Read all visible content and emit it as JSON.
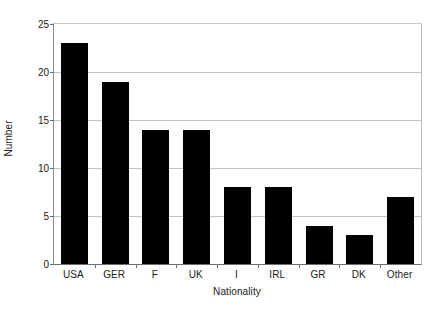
{
  "chart_data": {
    "type": "bar",
    "title": "",
    "xlabel": "Nationality",
    "ylabel": "Number",
    "categories": [
      "USA",
      "GER",
      "F",
      "UK",
      "I",
      "IRL",
      "GR",
      "DK",
      "Other"
    ],
    "values": [
      23,
      19,
      14,
      14,
      8,
      8,
      4,
      3,
      7
    ],
    "series": [
      {
        "name": "Number",
        "values": [
          23,
          19,
          14,
          14,
          8,
          8,
          4,
          3,
          7
        ]
      }
    ],
    "ylim": [
      0,
      25
    ],
    "yticks": [
      0,
      5,
      10,
      15,
      20,
      25
    ],
    "ytick_labels": [
      "0",
      "5",
      "10",
      "15",
      "20",
      "25"
    ],
    "grid": true,
    "grid_axis": "y",
    "legend": false,
    "bar_color": "#000000",
    "grid_color": "#c2c2c2",
    "axis_color": "#6e6e6e",
    "background_color": "#ffffff"
  }
}
